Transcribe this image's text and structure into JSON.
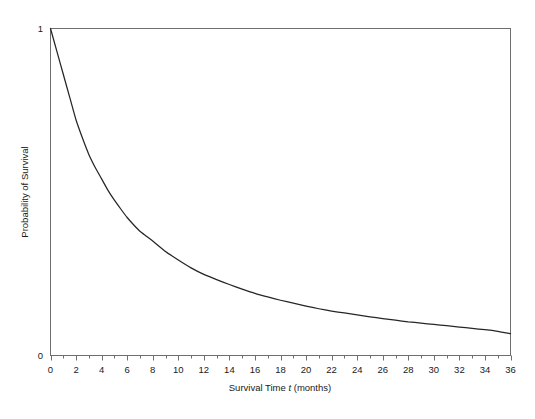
{
  "chart_data": {
    "type": "line",
    "title": "",
    "xlabel": "Survival Time t (months)",
    "xlabel_parts": {
      "pre": "Survival Time ",
      "italic": "t",
      "post": " (months)"
    },
    "ylabel": "Probability of Survival",
    "xlim": [
      0,
      36
    ],
    "ylim": [
      0,
      1
    ],
    "xticks": [
      0,
      2,
      4,
      6,
      8,
      10,
      12,
      14,
      16,
      18,
      20,
      22,
      24,
      26,
      28,
      30,
      32,
      34,
      36
    ],
    "xticklabels": [
      "0",
      "2",
      "4",
      "6",
      "8",
      "10",
      "12",
      "14",
      "16",
      "18",
      "20",
      "22",
      "24",
      "26",
      "28",
      "30",
      "32",
      "34",
      "36"
    ],
    "xtick_minor_step": 1,
    "yticks": [
      0,
      1
    ],
    "yticklabels": [
      "0",
      "1"
    ],
    "grid": false,
    "legend": null,
    "legend_position": "none",
    "series": [
      {
        "name": "Survival function S(t)",
        "color": "#262626",
        "linewidth": 1.25,
        "x": [
          0,
          0.5,
          1,
          1.5,
          2,
          2.5,
          3,
          3.5,
          4,
          4.5,
          5,
          5.5,
          6,
          6.5,
          7,
          7.5,
          8,
          9,
          10,
          11,
          12,
          13,
          14,
          15,
          16,
          17,
          18,
          19,
          20,
          21,
          22,
          23,
          24,
          25,
          26,
          27,
          28,
          29,
          30,
          31,
          32,
          33,
          34,
          35,
          36
        ],
        "values": [
          1.0,
          0.93,
          0.86,
          0.79,
          0.72,
          0.665,
          0.615,
          0.575,
          0.54,
          0.505,
          0.475,
          0.448,
          0.422,
          0.4,
          0.38,
          0.365,
          0.35,
          0.318,
          0.292,
          0.268,
          0.248,
          0.232,
          0.217,
          0.203,
          0.19,
          0.179,
          0.169,
          0.16,
          0.151,
          0.143,
          0.136,
          0.13,
          0.124,
          0.118,
          0.113,
          0.108,
          0.103,
          0.099,
          0.095,
          0.091,
          0.087,
          0.083,
          0.079,
          0.074,
          0.067
        ]
      }
    ],
    "annotations": []
  },
  "axes": {
    "y_top_label": "1",
    "y_bottom_label": "0",
    "y_axis_title": "Probability of Survival",
    "x_axis_title_pre": "Survival Time ",
    "x_axis_title_italic": "t",
    "x_axis_title_post": " (months)"
  },
  "colors": {
    "background": "#ffffff",
    "frame": "#6e6e6e",
    "curve": "#262626",
    "text": "#1a1a1a"
  }
}
